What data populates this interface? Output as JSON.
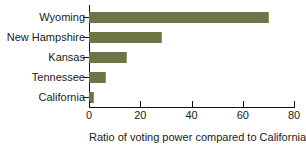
{
  "chart_data": {
    "type": "bar",
    "orientation": "horizontal",
    "title": "",
    "xlabel": "Ratio of voting power compared to California",
    "ylabel": "",
    "categories": [
      "Wyoming",
      "New Hampshire",
      "Kansas",
      "Tennessee",
      "California"
    ],
    "values": [
      70,
      28,
      14.5,
      6.3,
      1.6
    ],
    "xlim": [
      0,
      80
    ],
    "xticks": [
      0,
      20,
      40,
      60,
      80
    ],
    "xtick_labels": [
      "0",
      "20",
      "40",
      "60",
      "80"
    ],
    "grid": false,
    "legend": null,
    "series": [
      {
        "name": "Ratio of voting power compared to California",
        "values": [
          70,
          28,
          14.5,
          6.3,
          1.6
        ],
        "color": "#6d7547"
      }
    ]
  },
  "colors": {
    "bar": "#6d7547",
    "axis": "#111111",
    "text": "#1a1a1a",
    "background": "#ffffff"
  }
}
